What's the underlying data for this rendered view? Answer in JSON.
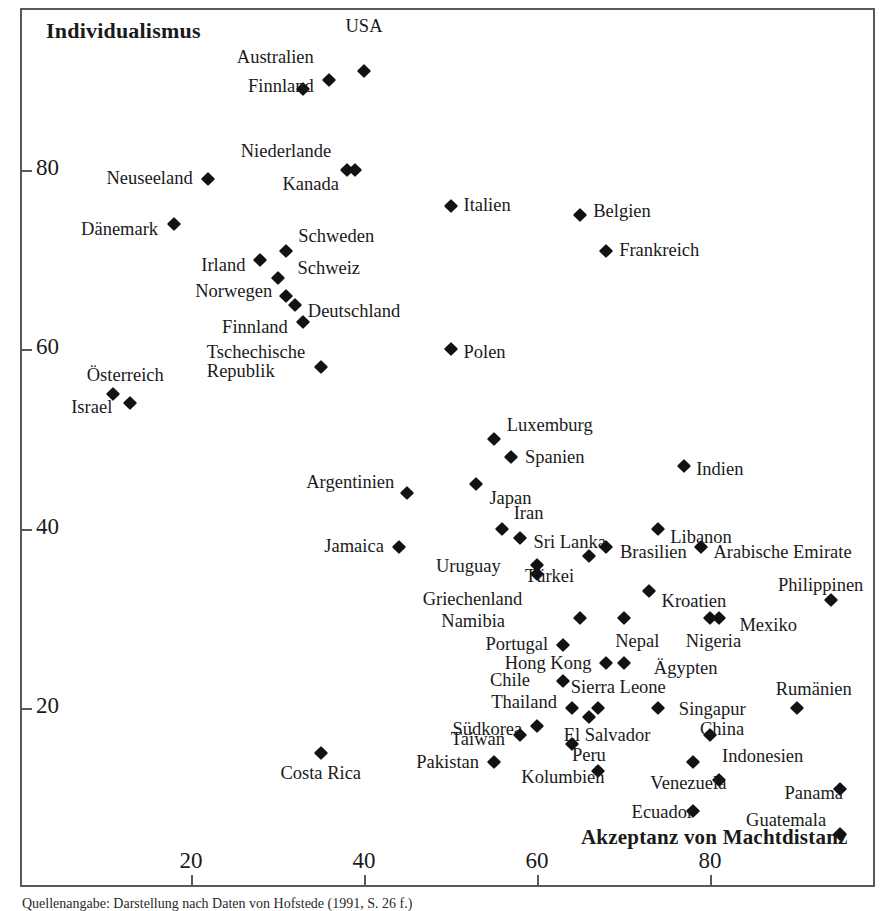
{
  "figure": {
    "caption": "Quellenangabe: Darstellung nach Daten von Hofstede (1991, S. 26 f.)"
  },
  "chart_data": {
    "type": "scatter",
    "title": "",
    "xlabel": "Akzeptanz von Machtdistanz",
    "ylabel": "Individualismus",
    "xlim": [
      10,
      97
    ],
    "ylim": [
      8,
      100
    ],
    "xticks": [
      20,
      40,
      60,
      80
    ],
    "xtick_labels": [
      "20",
      "40",
      "60",
      "80"
    ],
    "yticks": [
      20,
      40,
      60,
      80
    ],
    "ytick_labels": [
      "20",
      "40",
      "60",
      "80"
    ],
    "grid": false,
    "legend": "none",
    "marker": "diamond",
    "marker_color": "#121212",
    "frame_color": "#595959",
    "points": [
      {
        "label": "USA",
        "x": 40,
        "y": 91,
        "lx": 40,
        "ly": 96,
        "align": "c"
      },
      {
        "label": "Australien",
        "x": 36,
        "y": 90,
        "lx": 34.2,
        "ly": 92.5,
        "align": "r"
      },
      {
        "label": "Finnland",
        "x": 33,
        "y": 89,
        "lx": 34.2,
        "ly": 89.3,
        "align": "r"
      },
      {
        "label": "Niederlande",
        "x": 38,
        "y": 80,
        "lx": 36.2,
        "ly": 82.0,
        "align": "r"
      },
      {
        "label": "Kanada",
        "x": 39,
        "y": 80,
        "lx": 37.1,
        "ly": 78.3,
        "align": "r"
      },
      {
        "label": "Neuseeland",
        "x": 22,
        "y": 79,
        "lx": 20.2,
        "ly": 79.0,
        "align": "r"
      },
      {
        "label": "Dänemark",
        "x": 18,
        "y": 74,
        "lx": 16.2,
        "ly": 73.3,
        "align": "r"
      },
      {
        "label": "Italien",
        "x": 50,
        "y": 76,
        "lx": 51.5,
        "ly": 76.0,
        "align": "l"
      },
      {
        "label": "Belgien",
        "x": 65,
        "y": 75,
        "lx": 66.5,
        "ly": 75.3,
        "align": "l"
      },
      {
        "label": "Frankreich",
        "x": 68,
        "y": 71,
        "lx": 69.5,
        "ly": 71.0,
        "align": "l"
      },
      {
        "label": "Schweden",
        "x": 31,
        "y": 71,
        "lx": 32.4,
        "ly": 72.5,
        "align": "l"
      },
      {
        "label": "Irland",
        "x": 28,
        "y": 70,
        "lx": 26.3,
        "ly": 69.3,
        "align": "r"
      },
      {
        "label": "Schweiz",
        "x": 30,
        "y": 68,
        "lx": 32.3,
        "ly": 69.0,
        "align": "l"
      },
      {
        "label": "Norwegen",
        "x": 31,
        "y": 66,
        "lx": 29.4,
        "ly": 66.4,
        "align": "r"
      },
      {
        "label": "Deutschland",
        "x": 32,
        "y": 65,
        "lx": 33.5,
        "ly": 64.2,
        "align": "l"
      },
      {
        "label": "Finnland",
        "x": 33,
        "y": 63,
        "lx": 31.2,
        "ly": 62.4,
        "align": "r"
      },
      {
        "label": "Tschechische\nRepublik",
        "x": 35,
        "y": 58,
        "lx": 33.2,
        "ly": 58.6,
        "align": "r"
      },
      {
        "label": "Polen",
        "x": 50,
        "y": 60,
        "lx": 51.5,
        "ly": 59.6,
        "align": "l"
      },
      {
        "label": "Österreich",
        "x": 11,
        "y": 55,
        "lx": 12.4,
        "ly": 57.0,
        "align": "c"
      },
      {
        "label": "Israel",
        "x": 13,
        "y": 54,
        "lx": 10.9,
        "ly": 53.5,
        "align": "r"
      },
      {
        "label": "Luxemburg",
        "x": 55,
        "y": 50,
        "lx": 56.5,
        "ly": 51.5,
        "align": "l"
      },
      {
        "label": "Spanien",
        "x": 57,
        "y": 48,
        "lx": 58.6,
        "ly": 47.9,
        "align": "l"
      },
      {
        "label": "Indien",
        "x": 77,
        "y": 47,
        "lx": 78.4,
        "ly": 46.5,
        "align": "l"
      },
      {
        "label": "Argentinien",
        "x": 45,
        "y": 44,
        "lx": 43.5,
        "ly": 45.1,
        "align": "r"
      },
      {
        "label": "Japan",
        "x": 53,
        "y": 45,
        "lx": 54.5,
        "ly": 43.3,
        "align": "l"
      },
      {
        "label": "Iran",
        "x": 56,
        "y": 40,
        "lx": 57.3,
        "ly": 41.6,
        "align": "l"
      },
      {
        "label": "Sri Lanka",
        "x": 58,
        "y": 39,
        "lx": 59.6,
        "ly": 38.4,
        "align": "l"
      },
      {
        "label": "Jamaica",
        "x": 44,
        "y": 38,
        "lx": 42.3,
        "ly": 38.0,
        "align": "r"
      },
      {
        "label": "Libanon",
        "x": 74,
        "y": 40,
        "lx": 75.4,
        "ly": 39.0,
        "align": "l"
      },
      {
        "label": "Brasilien",
        "x": 68,
        "y": 38,
        "lx": 69.6,
        "ly": 37.3,
        "align": "l"
      },
      {
        "label": "Arabische Emirate",
        "x": 79,
        "y": 38,
        "lx": 80.4,
        "ly": 37.3,
        "align": "l"
      },
      {
        "label": "Uruguay",
        "x": 60,
        "y": 36,
        "lx": 55.8,
        "ly": 35.7,
        "align": "r"
      },
      {
        "label": "Türkei",
        "x": 66,
        "y": 37,
        "lx": 64.3,
        "ly": 34.6,
        "align": "r"
      },
      {
        "label": "Griechenland",
        "x": 60,
        "y": 35,
        "lx": 58.3,
        "ly": 32.0,
        "align": "r"
      },
      {
        "label": "Kroatien",
        "x": 73,
        "y": 33,
        "lx": 74.4,
        "ly": 31.8,
        "align": "l"
      },
      {
        "label": "Philippinen",
        "x": 94,
        "y": 32,
        "lx": 92.8,
        "ly": 33.6,
        "align": "c"
      },
      {
        "label": "Namibia",
        "x": 65,
        "y": 30,
        "lx": 56.3,
        "ly": 29.6,
        "align": "r"
      },
      {
        "label": "Mexiko",
        "x": 81,
        "y": 30,
        "lx": 83.4,
        "ly": 29.2,
        "align": "l"
      },
      {
        "label": "Nepal",
        "x": 70,
        "y": 30,
        "lx": 71.6,
        "ly": 27.4,
        "align": "c"
      },
      {
        "label": "Nigeria",
        "x": 80,
        "y": 30,
        "lx": 80.4,
        "ly": 27.4,
        "align": "c"
      },
      {
        "label": "Portugal",
        "x": 63,
        "y": 27,
        "lx": 61.3,
        "ly": 27.0,
        "align": "r"
      },
      {
        "label": "Hong Kong",
        "x": 68,
        "y": 25,
        "lx": 66.3,
        "ly": 24.9,
        "align": "r"
      },
      {
        "label": "Ägypten",
        "x": 70,
        "y": 25,
        "lx": 73.5,
        "ly": 24.4,
        "align": "l"
      },
      {
        "label": "Chile",
        "x": 63,
        "y": 23,
        "lx": 59.2,
        "ly": 23.0,
        "align": "r"
      },
      {
        "label": "Sierra Leone",
        "x": 67,
        "y": 20,
        "lx": 69.4,
        "ly": 22.2,
        "align": "c"
      },
      {
        "label": "Rumänien",
        "x": 90,
        "y": 20,
        "lx": 92.0,
        "ly": 22.0,
        "align": "c"
      },
      {
        "label": "Thailand",
        "x": 64,
        "y": 20,
        "lx": 62.3,
        "ly": 20.6,
        "align": "r"
      },
      {
        "label": "Singapur",
        "x": 74,
        "y": 20,
        "lx": 76.4,
        "ly": 19.8,
        "align": "l"
      },
      {
        "label": "Südkorea",
        "x": 60,
        "y": 18,
        "lx": 58.3,
        "ly": 17.6,
        "align": "r"
      },
      {
        "label": "Taiwan",
        "x": 58,
        "y": 17,
        "lx": 56.3,
        "ly": 16.4,
        "align": "r"
      },
      {
        "label": "El Salvador",
        "x": 66,
        "y": 19,
        "lx": 68.1,
        "ly": 16.9,
        "align": "c"
      },
      {
        "label": "China",
        "x": 80,
        "y": 17,
        "lx": 81.4,
        "ly": 17.6,
        "align": "c"
      },
      {
        "label": "Peru",
        "x": 64,
        "y": 16,
        "lx": 66.0,
        "ly": 14.7,
        "align": "c"
      },
      {
        "label": "Indonesien",
        "x": 78,
        "y": 14,
        "lx": 81.4,
        "ly": 14.5,
        "align": "l"
      },
      {
        "label": "Pakistan",
        "x": 55,
        "y": 14,
        "lx": 53.3,
        "ly": 13.9,
        "align": "r"
      },
      {
        "label": "Costa Rica",
        "x": 35,
        "y": 15,
        "lx": 35.0,
        "ly": 12.6,
        "align": "c"
      },
      {
        "label": "Kolumbien",
        "x": 67,
        "y": 13,
        "lx": 63.0,
        "ly": 12.2,
        "align": "c"
      },
      {
        "label": "Venezuela",
        "x": 81,
        "y": 12,
        "lx": 77.5,
        "ly": 11.5,
        "align": "c"
      },
      {
        "label": "Panama",
        "x": 95,
        "y": 11,
        "lx": 92.0,
        "ly": 10.4,
        "align": "c"
      },
      {
        "label": "Ecuador",
        "x": 78,
        "y": 8.5,
        "lx": 74.5,
        "ly": 8.3,
        "align": "c"
      },
      {
        "label": "Guatemala",
        "x": 95,
        "y": 6,
        "lx": 88.8,
        "ly": 7.4,
        "align": "c"
      }
    ]
  }
}
